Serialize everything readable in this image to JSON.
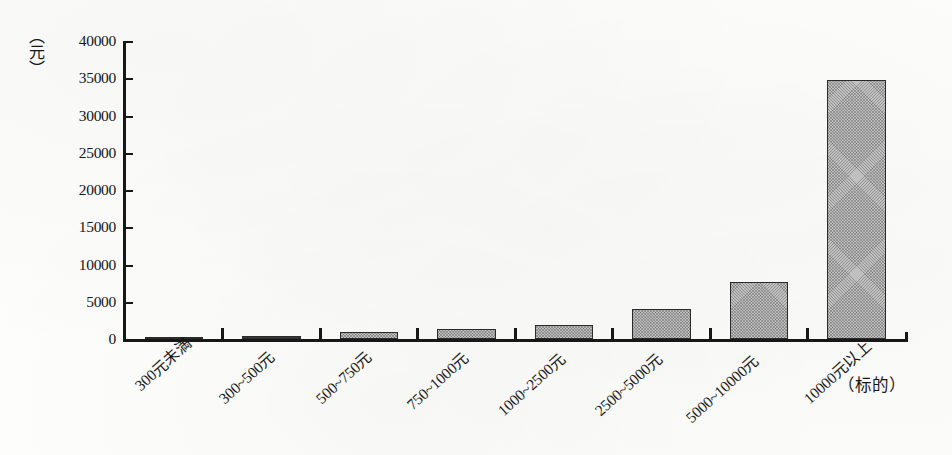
{
  "chart_data": {
    "type": "bar",
    "title": "",
    "xlabel": "（标的）",
    "ylabel": "（元）",
    "ylim": [
      0,
      40000
    ],
    "yticks": [
      0,
      5000,
      10000,
      15000,
      20000,
      25000,
      30000,
      35000,
      40000
    ],
    "ytick_labels": [
      "0",
      "5000",
      "10000",
      "15000",
      "20000",
      "25000",
      "30000",
      "35000",
      "40000"
    ],
    "grid": false,
    "legend": null,
    "categories": [
      "300元未満",
      "300~500元",
      "500~750元",
      "750~1000元",
      "1000~2500元",
      "2500~5000元",
      "5000~10000元",
      "10000元以上"
    ],
    "values": [
      100,
      400,
      1000,
      1400,
      1900,
      4000,
      7600,
      34800
    ],
    "bar_color": "#c3c3c3",
    "bar_edge_color": "#2b2b2b",
    "axis_color": "#171717",
    "background_color": "#fdfdfc"
  }
}
